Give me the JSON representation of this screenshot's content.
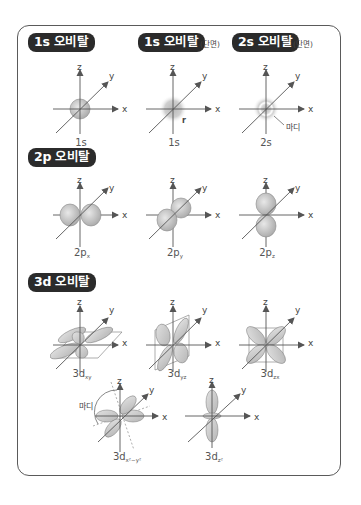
{
  "sections": {
    "s1": {
      "title": "1s 오비탈"
    },
    "s1_cross": {
      "title": "1s 오비탈",
      "note": "(단면)"
    },
    "s2_cross": {
      "title": "2s 오비탈",
      "note": "(단면)"
    },
    "p2": {
      "title": "2p 오비탈"
    },
    "d3": {
      "title": "3d 오비탈"
    }
  },
  "axes": {
    "x": "x",
    "y": "y",
    "z": "z"
  },
  "labels": {
    "s1": "1s",
    "s1_cross": "1s",
    "s1_cross_radius": "r",
    "s2_cross": "2s",
    "node": "마디",
    "p_x": {
      "base": "2p",
      "sub": "x"
    },
    "p_y": {
      "base": "2p",
      "sub": "y"
    },
    "p_z": {
      "base": "2p",
      "sub": "z"
    },
    "d_xy": {
      "base": "3d",
      "sub": "xy"
    },
    "d_yz": {
      "base": "3d",
      "sub": "yz"
    },
    "d_zx": {
      "base": "3d",
      "sub": "zx"
    },
    "d_x2y2": {
      "base": "3d",
      "sub": "x²−y²"
    },
    "d_z2": {
      "base": "3d",
      "sub": "z²"
    }
  },
  "colors": {
    "tag_bg": "#2b2b2b",
    "frame": "#5a5a5a",
    "lobe_fill": "#cfcfcf",
    "axis": "#555555"
  }
}
